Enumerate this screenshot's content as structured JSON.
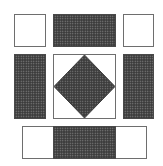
{
  "diagram": {
    "title": "",
    "colors": {
      "background": "#ffffff",
      "outline": "#6e6e6e",
      "dark_fill": "#3b3b3b",
      "dot": "#8a8a8a"
    },
    "pieces": [
      {
        "id": "top-left-square",
        "fill": "white",
        "x": 14,
        "y": 14,
        "w": 32,
        "h": 33
      },
      {
        "id": "top-center-bar",
        "fill": "dark",
        "x": 53,
        "y": 14,
        "w": 63,
        "h": 33
      },
      {
        "id": "top-right-square",
        "fill": "white",
        "x": 123,
        "y": 14,
        "w": 31,
        "h": 33
      },
      {
        "id": "middle-left-bar",
        "fill": "dark",
        "x": 14,
        "y": 54,
        "w": 32,
        "h": 65
      },
      {
        "id": "center-square",
        "fill": "white",
        "x": 53,
        "y": 54,
        "w": 63,
        "h": 65,
        "inset": "diamond"
      },
      {
        "id": "middle-right-bar",
        "fill": "dark",
        "x": 123,
        "y": 54,
        "w": 31,
        "h": 65
      },
      {
        "id": "bottom-strip",
        "fill": "white",
        "x": 22,
        "y": 126,
        "w": 125,
        "h": 33
      },
      {
        "id": "bottom-strip-center",
        "fill": "dark",
        "x": 53,
        "y": 126,
        "w": 63,
        "h": 33
      }
    ]
  }
}
